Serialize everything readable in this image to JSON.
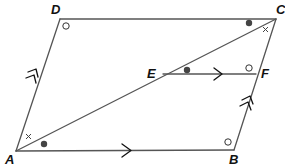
{
  "diagram": {
    "colors": {
      "lines": "#555555",
      "labels": "#111111",
      "dots": "#444444",
      "background": "#ffffff"
    },
    "vertices": {
      "A": {
        "label": "A",
        "x": 16,
        "y": 151
      },
      "B": {
        "label": "B",
        "x": 234,
        "y": 150
      },
      "C": {
        "label": "C",
        "x": 276,
        "y": 19
      },
      "D": {
        "label": "D",
        "x": 60,
        "y": 19
      },
      "E": {
        "label": "E",
        "x": 163,
        "y": 74
      },
      "F": {
        "label": "F",
        "x": 256,
        "y": 74
      }
    },
    "segments": [
      {
        "from": "A",
        "to": "B",
        "marker": "single-arrow"
      },
      {
        "from": "B",
        "to": "C",
        "marker": "double-arrow"
      },
      {
        "from": "C",
        "to": "D",
        "marker": "none"
      },
      {
        "from": "D",
        "to": "A",
        "marker": "double-arrow"
      },
      {
        "from": "A",
        "to": "C",
        "marker": "none"
      },
      {
        "from": "E",
        "to": "F",
        "marker": "single-arrow"
      }
    ],
    "angle_marks": [
      {
        "at": "D",
        "type": "circle"
      },
      {
        "at": "B",
        "type": "circle"
      },
      {
        "at": "F",
        "type": "circle",
        "angle": "EFC"
      },
      {
        "at": "C",
        "type": "dot",
        "angle": "DCA"
      },
      {
        "at": "C",
        "type": "cross",
        "angle": "ACB"
      },
      {
        "at": "E",
        "type": "dot",
        "angle": "FEC"
      },
      {
        "at": "A",
        "type": "dot",
        "angle": "CAB"
      },
      {
        "at": "A",
        "type": "cross",
        "angle": "DAC"
      }
    ]
  }
}
